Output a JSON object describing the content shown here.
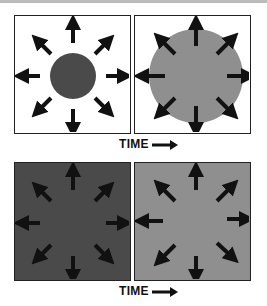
{
  "panels": [
    {
      "id": "top-left",
      "bg": "#ffffff",
      "circle_color": "#4a4a4a",
      "circle_radius": 23
    },
    {
      "id": "top-right",
      "bg": "#ffffff",
      "circle_color": "#8f8f8f",
      "circle_radius": 47
    },
    {
      "id": "bottom-left",
      "bg": "#4a4a4a"
    },
    {
      "id": "bottom-right",
      "bg": "#8f8f8f"
    }
  ],
  "labels": {
    "time_top": "TIME",
    "time_bottom": "TIME"
  },
  "arrow_color": "#111111"
}
